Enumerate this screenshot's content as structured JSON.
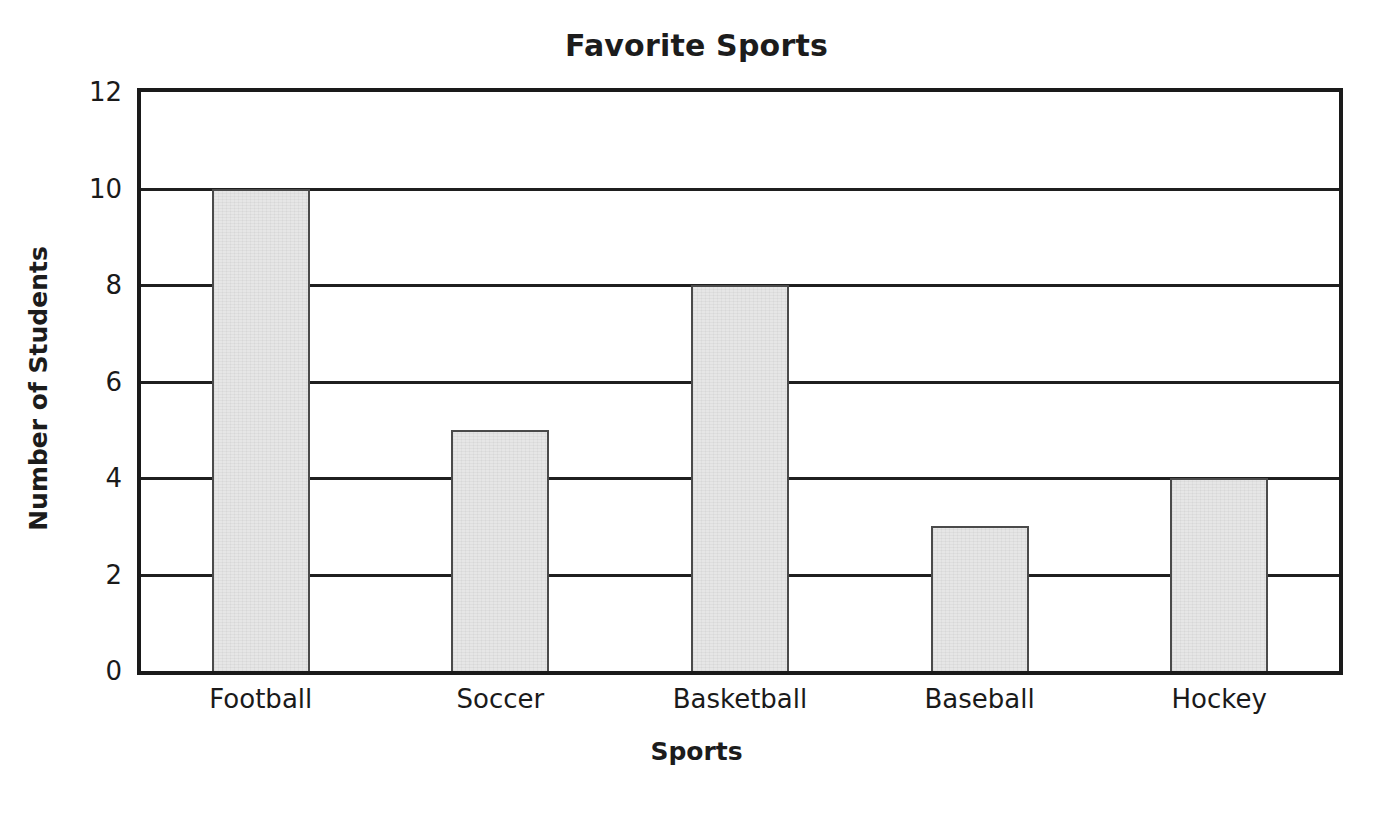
{
  "chart_data": {
    "type": "bar",
    "title": "Favorite Sports",
    "xlabel": "Sports",
    "ylabel": "Number of Students",
    "categories": [
      "Football",
      "Soccer",
      "Basketball",
      "Baseball",
      "Hockey"
    ],
    "values": [
      10,
      5,
      8,
      3,
      4
    ],
    "ylim": [
      0,
      12
    ],
    "ytick_labels": [
      "12",
      "10",
      "8",
      "6",
      "4",
      "2",
      "0"
    ],
    "ytick_values": [
      12,
      10,
      8,
      6,
      4,
      2,
      0
    ],
    "grid": true,
    "gridlines_at": [
      10,
      8,
      6,
      4,
      2
    ],
    "legend": "none",
    "bar_fill_color": "#e6e6e6",
    "bar_edge_color": "#4a4a4a",
    "axis_color": "#1a1a1a",
    "background_color": "#ffffff"
  }
}
